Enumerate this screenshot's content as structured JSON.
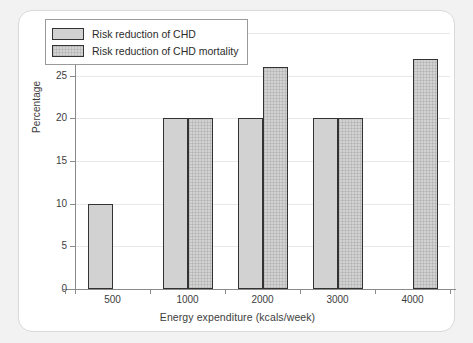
{
  "chart_data": {
    "type": "bar",
    "title": "",
    "subtitle": "",
    "xlabel": "Energy expenditure (kcals/week)",
    "ylabel": "Percentage",
    "categories": [
      "500",
      "1000",
      "2000",
      "3000",
      "4000"
    ],
    "series": [
      {
        "name": "Risk reduction of CHD",
        "values": [
          10,
          20,
          20,
          20,
          null
        ]
      },
      {
        "name": "Risk reduction of CHD mortality",
        "values": [
          null,
          20,
          26,
          20,
          27
        ]
      }
    ],
    "ylim": [
      0,
      30
    ],
    "yticks": [
      0,
      5,
      10,
      15,
      20,
      25,
      30
    ],
    "ytick_labels": [
      "0",
      "5",
      "10",
      "15",
      "20",
      "25",
      "30"
    ],
    "grid": true,
    "legend_position": "top-left",
    "legend_entries": [
      "Risk reduction of CHD",
      "Risk reduction of CHD mortality"
    ],
    "colors": {
      "series_0_fill": "#d2d2d2",
      "series_1_fill": "#d2d2d2",
      "bar_border": "#333333",
      "gridline": "#e8e8e8",
      "axis": "#8a8a8a",
      "text": "#3d3d3d",
      "plot_background": "#ffffff",
      "page_background": "#f2f2f2",
      "card_border": "#d9d9d9"
    }
  }
}
